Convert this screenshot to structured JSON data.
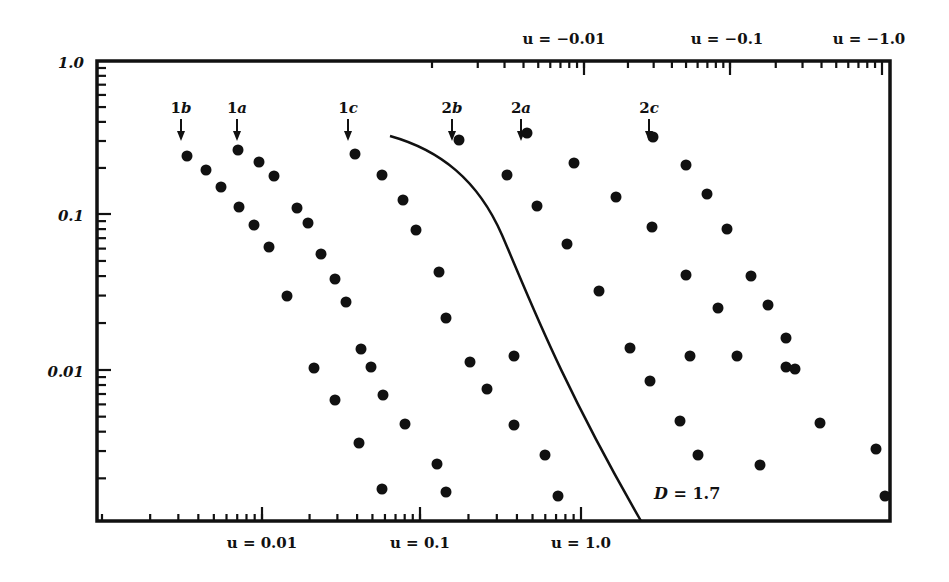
{
  "chart_data": {
    "type": "scatter",
    "title": "",
    "xlabel_bottom": "u (positive, log scale)",
    "xlabel_top": "u (negative, log scale)",
    "ylabel": "",
    "y_scale": "log",
    "ylim": [
      0.001,
      1.0
    ],
    "y_tick_labels": [
      "1.0",
      "0.1",
      "0.01"
    ],
    "bottom_axis_labels": [
      {
        "text": "u = 0.01",
        "u": 0.01
      },
      {
        "text": "u = 0.1",
        "u": 0.1
      },
      {
        "text": "u = 1.0",
        "u": 1.0
      }
    ],
    "top_axis_labels": [
      {
        "text": "u = −0.01",
        "u": -0.01
      },
      {
        "text": "u = −0.1",
        "u": -0.1
      },
      {
        "text": "u = −1.0",
        "u": -1.0
      }
    ],
    "series_markers": [
      {
        "label": "1b",
        "x_px": 181
      },
      {
        "label": "1a",
        "x_px": 237
      },
      {
        "label": "1c",
        "x_px": 348
      },
      {
        "label": "2b",
        "x_px": 452
      },
      {
        "label": "2a",
        "x_px": 521
      },
      {
        "label": "2c",
        "x_px": 649
      }
    ],
    "curve": {
      "label": "D = 1.7",
      "description": "boundary curve starting near (u≈0.06, y≈0.3) descending to bottom axis near u≈2.3, y≈0.001"
    },
    "points_px": [
      [
        187,
        156
      ],
      [
        206,
        170
      ],
      [
        221,
        187
      ],
      [
        239,
        207
      ],
      [
        254,
        225
      ],
      [
        269,
        247
      ],
      [
        287,
        296
      ],
      [
        238,
        150
      ],
      [
        259,
        162
      ],
      [
        274,
        176
      ],
      [
        297,
        208
      ],
      [
        308,
        223
      ],
      [
        321,
        254
      ],
      [
        335,
        279
      ],
      [
        346,
        302
      ],
      [
        314,
        368
      ],
      [
        335,
        400
      ],
      [
        359,
        443
      ],
      [
        355,
        154
      ],
      [
        382,
        175
      ],
      [
        403,
        200
      ],
      [
        416,
        230
      ],
      [
        439,
        272
      ],
      [
        446,
        318
      ],
      [
        361,
        349
      ],
      [
        371,
        367
      ],
      [
        383,
        395
      ],
      [
        405,
        424
      ],
      [
        382,
        489
      ],
      [
        437,
        464
      ],
      [
        446,
        492
      ],
      [
        459,
        140
      ],
      [
        507,
        175
      ],
      [
        537,
        206
      ],
      [
        567,
        244
      ],
      [
        599,
        291
      ],
      [
        630,
        348
      ],
      [
        650,
        381
      ],
      [
        680,
        421
      ],
      [
        698,
        455
      ],
      [
        760,
        465
      ],
      [
        876,
        449
      ],
      [
        885,
        496
      ],
      [
        527,
        133
      ],
      [
        574,
        163
      ],
      [
        616,
        197
      ],
      [
        652,
        227
      ],
      [
        686,
        275
      ],
      [
        718,
        308
      ],
      [
        737,
        356
      ],
      [
        786,
        367
      ],
      [
        820,
        423
      ],
      [
        653,
        137
      ],
      [
        686,
        165
      ],
      [
        707,
        194
      ],
      [
        727,
        229
      ],
      [
        751,
        276
      ],
      [
        768,
        305
      ],
      [
        786,
        338
      ],
      [
        795,
        369
      ],
      [
        690,
        356
      ],
      [
        470,
        362
      ],
      [
        514,
        425
      ],
      [
        545,
        455
      ],
      [
        558,
        496
      ],
      [
        487,
        389
      ],
      [
        514,
        356
      ]
    ],
    "colors": {
      "ink": "#111111",
      "background": "#ffffff"
    }
  }
}
